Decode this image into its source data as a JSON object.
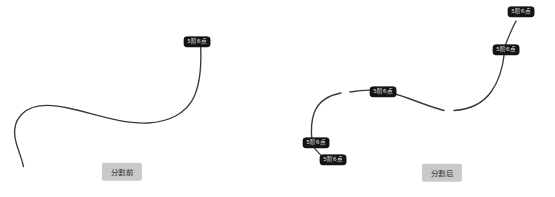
{
  "figure": {
    "background_color": "#ffffff",
    "curve_color": "#3a3a3a",
    "tag_background": "#141414",
    "tag_text_color": "#e8e8e8",
    "caption_background": "#c9c9c9",
    "caption_text_color": "#2a2a2a"
  },
  "panels": {
    "before": {
      "caption": "分割前",
      "tags": [
        {
          "text": "5阶6点"
        }
      ]
    },
    "after": {
      "caption": "分割后",
      "tags": [
        {
          "text": "5阶6点"
        },
        {
          "text": "5阶6点"
        },
        {
          "text": "5阶6点"
        },
        {
          "text": "5阶6点"
        },
        {
          "text": "5阶6点"
        }
      ]
    }
  }
}
